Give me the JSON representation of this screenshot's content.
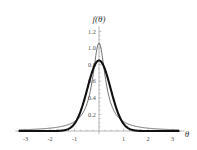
{
  "chart_data": {
    "type": "line",
    "title": "",
    "xlabel": "θ",
    "ylabel": "f(θ)",
    "xlim": [
      -3.25,
      3.25
    ],
    "ylim": [
      0,
      1.26
    ],
    "grid": false,
    "legend": "none",
    "xticks": [
      -3,
      -2,
      -1,
      1,
      2,
      3
    ],
    "xtick_labels": [
      "-3",
      "-2",
      "-1",
      "1",
      "2",
      "3"
    ],
    "yticks": [
      0.2,
      0.4,
      0.6,
      0.8,
      1.0,
      1.2
    ],
    "ytick_labels": [
      "0.2",
      "0.4",
      "0.6",
      "0.8",
      "1.0",
      "1.2"
    ],
    "x": [
      -3.2,
      -3.0,
      -2.8,
      -2.6,
      -2.4,
      -2.2,
      -2.0,
      -1.8,
      -1.6,
      -1.4,
      -1.2,
      -1.0,
      -0.8,
      -0.6,
      -0.4,
      -0.2,
      0.0,
      0.2,
      0.4,
      0.6,
      0.8,
      1.0,
      1.2,
      1.4,
      1.6,
      1.8,
      2.0,
      2.2,
      2.4,
      2.6,
      2.8,
      3.0,
      3.2
    ],
    "series": [
      {
        "name": "heavy-tailed-curve",
        "style": "thin",
        "peak_x": 0.0,
        "peak_y": 1.06,
        "values": [
          0.028,
          0.032,
          0.037,
          0.043,
          0.051,
          0.061,
          0.074,
          0.092,
          0.116,
          0.151,
          0.203,
          0.282,
          0.404,
          0.589,
          0.822,
          1.019,
          1.06,
          1.019,
          0.822,
          0.589,
          0.404,
          0.282,
          0.203,
          0.151,
          0.116,
          0.092,
          0.074,
          0.061,
          0.051,
          0.043,
          0.037,
          0.032,
          0.028
        ]
      },
      {
        "name": "narrow-curve",
        "style": "thick",
        "peak_x": 0.0,
        "peak_y": 0.85,
        "values": [
          0.0,
          0.0,
          0.0,
          0.0,
          0.001,
          0.001,
          0.002,
          0.004,
          0.008,
          0.017,
          0.036,
          0.074,
          0.146,
          0.272,
          0.466,
          0.707,
          0.85,
          0.707,
          0.466,
          0.272,
          0.146,
          0.074,
          0.036,
          0.017,
          0.008,
          0.004,
          0.002,
          0.001,
          0.001,
          0.0,
          0.0,
          0.0,
          0.0
        ]
      }
    ]
  },
  "colors": {
    "background": "#ffffff",
    "axis": "#9a9a9a",
    "thin_curve": "#555555",
    "thick_curve": "#111111",
    "tick_text": "#4a4a4a"
  }
}
